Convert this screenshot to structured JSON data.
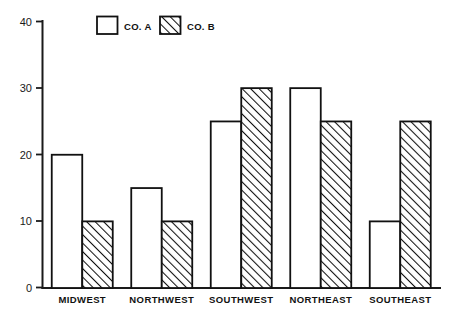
{
  "chart_data": {
    "type": "bar",
    "title": "",
    "subtitle": "",
    "xlabel": "",
    "ylabel": "",
    "categories": [
      "MIDWEST",
      "NORTHWEST",
      "SOUTHWEST",
      "NORTHEAST",
      "SOUTHEAST"
    ],
    "series": [
      {
        "name": "CO. A",
        "values": [
          20,
          15,
          25,
          30,
          10
        ],
        "fill": "solid-white",
        "color": "#ffffff"
      },
      {
        "name": "CO. B",
        "values": [
          10,
          10,
          30,
          25,
          25
        ],
        "fill": "diagonal-hatch",
        "color": "#ffffff"
      }
    ],
    "ylim": [
      0,
      40
    ],
    "yticks": [
      0,
      10,
      20,
      30,
      40
    ],
    "ytick_labels": [
      "0",
      "10",
      "20",
      "30",
      "40"
    ],
    "grid": false,
    "legend_position": "top-center",
    "legend_entries": [
      "CO. A",
      "CO. B"
    ],
    "line_color": "#111111",
    "background": "#ffffff"
  },
  "legend": {
    "items": [
      {
        "label": "CO. A",
        "swatch": "empty-box-swatch"
      },
      {
        "label": "CO. B",
        "swatch": "hatched-box-swatch"
      }
    ]
  },
  "axes": {
    "y_tick_labels": [
      "40",
      "30",
      "20",
      "10",
      "0"
    ],
    "x_category_labels": [
      "MIDWEST",
      "NORTHWEST",
      "SOUTHWEST",
      "NORTHEAST",
      "SOUTHEAST"
    ]
  }
}
